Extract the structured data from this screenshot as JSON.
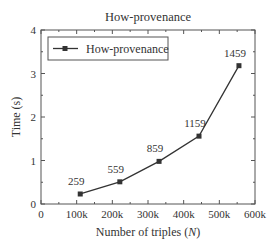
{
  "chart_data": {
    "type": "line",
    "title": "How-provenance",
    "xlabel": "Number of triples (N)",
    "xlabel_prefix": "Number of triples (",
    "xlabel_var": "N",
    "xlabel_suffix": ")",
    "ylabel": "Time (s)",
    "xlim": [
      0,
      600000
    ],
    "ylim": [
      0,
      4
    ],
    "x_ticks": [
      "0",
      "100k",
      "200k",
      "300k",
      "400k",
      "500k",
      "600k"
    ],
    "y_ticks": [
      "0",
      "1",
      "2",
      "3",
      "4"
    ],
    "grid": false,
    "legend_position": "upper left",
    "series": [
      {
        "name": "How-provenance",
        "marker": "square",
        "color": "#333333",
        "x": [
          110000,
          221000,
          331000,
          443000,
          555000
        ],
        "values": [
          0.23,
          0.51,
          0.98,
          1.56,
          3.18
        ],
        "labels": [
          "259",
          "559",
          "859",
          "1159",
          "1459"
        ]
      }
    ]
  }
}
